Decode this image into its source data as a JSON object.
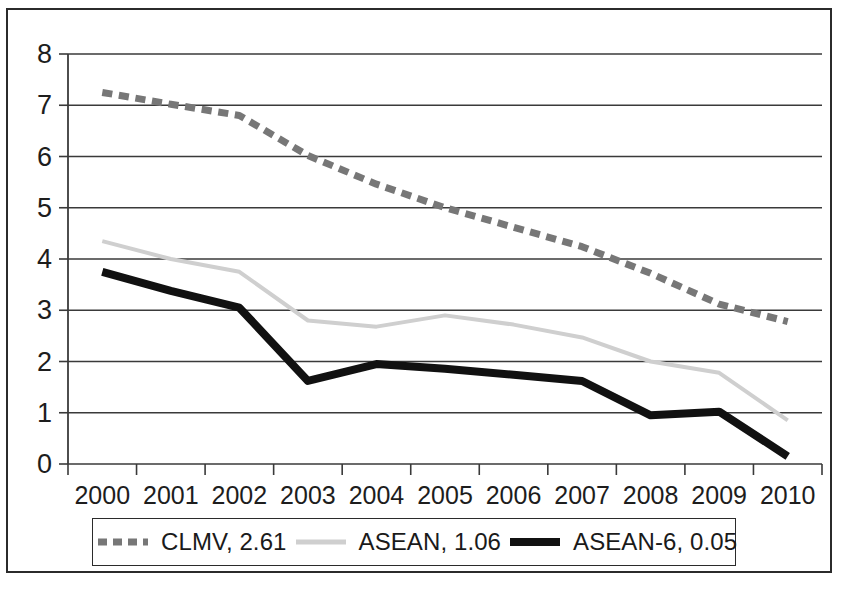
{
  "chart_data": {
    "type": "line",
    "title": "",
    "subtitle": "",
    "xlabel": "",
    "ylabel": "",
    "categories": [
      "2000",
      "2001",
      "2002",
      "2003",
      "2004",
      "2005",
      "2006",
      "2007",
      "2008",
      "2009",
      "2010"
    ],
    "xlim_categories": true,
    "ylim": [
      0,
      8
    ],
    "ytick_values": [
      0,
      1,
      2,
      3,
      4,
      5,
      6,
      7,
      8
    ],
    "ytick_labels": [
      "0",
      "1",
      "2",
      "3",
      "4",
      "5",
      "6",
      "7",
      "8"
    ],
    "grid": "horizontal",
    "legend_position": "bottom",
    "series": [
      {
        "name": "CLMV",
        "legend_label": "CLMV, 2.61",
        "end_value": 2.61,
        "style": "dashed",
        "color": "#777777",
        "width": 7,
        "values": [
          7.25,
          7.02,
          6.8,
          6.02,
          5.46,
          5.0,
          4.62,
          4.24,
          3.72,
          3.12,
          2.78
        ]
      },
      {
        "name": "ASEAN",
        "legend_label": "ASEAN, 1.06",
        "end_value": 1.06,
        "style": "solid",
        "color": "#cfcfcf",
        "width": 4,
        "values": [
          4.35,
          4.0,
          3.75,
          2.8,
          2.68,
          2.9,
          2.72,
          2.47,
          2.0,
          1.78,
          0.85
        ]
      },
      {
        "name": "ASEAN-6",
        "legend_label": "ASEAN-6, 0.05",
        "end_value": 0.05,
        "style": "solid",
        "color": "#111111",
        "width": 8,
        "values": [
          3.75,
          3.38,
          3.05,
          1.62,
          1.95,
          1.86,
          1.74,
          1.62,
          0.95,
          1.02,
          0.15
        ]
      }
    ]
  },
  "legend": {
    "entries": [
      {
        "label": "CLMV, 2.61",
        "swatch": "dashed-gray-line-swatch"
      },
      {
        "label": "ASEAN, 1.06",
        "swatch": "solid-lightgray-line-swatch"
      },
      {
        "label": "ASEAN-6, 0.05",
        "swatch": "solid-black-line-swatch"
      }
    ]
  }
}
